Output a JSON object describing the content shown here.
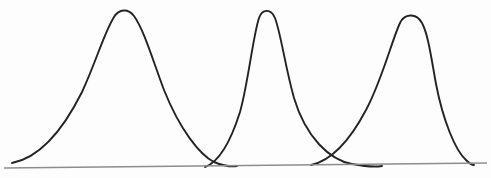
{
  "figure": {
    "title": "",
    "background_color": "#fdfdfd",
    "width": 491,
    "height": 178
  },
  "baseline": {
    "label": "horizontal-axis-line",
    "color": "#8d8d8d",
    "stroke_width": 1.6,
    "x_start": 4,
    "y_start": 168,
    "x_end": 487,
    "y_end": 163
  },
  "chart_data": {
    "type": "line",
    "title": "",
    "subtitle": "",
    "xlabel": "",
    "ylabel": "",
    "xlim": [
      0,
      491
    ],
    "ylim": [
      178,
      0
    ],
    "grid": false,
    "legend": false,
    "axes_visible": "baseline-only",
    "stroke_color": "#232323",
    "stroke_width": 1.9,
    "series": [
      {
        "name": "curve-1",
        "peak_x": 123,
        "peak_y": 9,
        "peak_height": 159,
        "left_foot_x": 12,
        "left_foot_y": 163,
        "right_foot_x": 237,
        "right_foot_y": 166,
        "width": 225,
        "shape": "broad-gentle-left-tail",
        "path": "M 12 163 C 38 158, 62 132, 82 92 C 96 62, 104 33, 114 17 C 119 9, 128 8, 134 16 C 144 30, 152 58, 164 90 C 180 130, 200 155, 214 162 C 224 166, 232 167, 237 166"
      },
      {
        "name": "curve-2",
        "peak_x": 266,
        "peak_y": 9,
        "peak_height": 159,
        "left_foot_x": 205,
        "left_foot_y": 167,
        "right_foot_x": 382,
        "right_foot_y": 166,
        "width": 177,
        "shape": "narrow-steep-left-flank",
        "path": "M 205 167 C 216 163, 228 150, 240 112 C 248 84, 253 36, 259 18 C 262 9, 271 8, 275 18 C 281 34, 285 66, 294 98 C 306 138, 330 160, 352 164 C 368 167, 376 167, 382 166"
      },
      {
        "name": "curve-3",
        "peak_x": 412,
        "peak_y": 14,
        "peak_height": 152,
        "left_foot_x": 311,
        "left_foot_y": 165,
        "right_foot_x": 474,
        "right_foot_y": 165,
        "width": 163,
        "shape": "narrow-steep-right-flank",
        "path": "M 311 165 C 330 161, 348 144, 366 110 C 382 80, 392 40, 400 23 C 404 14, 416 12, 422 23 C 428 34, 431 56, 436 84 C 443 120, 455 150, 466 160 C 470 164, 472 165, 474 165"
      }
    ]
  }
}
